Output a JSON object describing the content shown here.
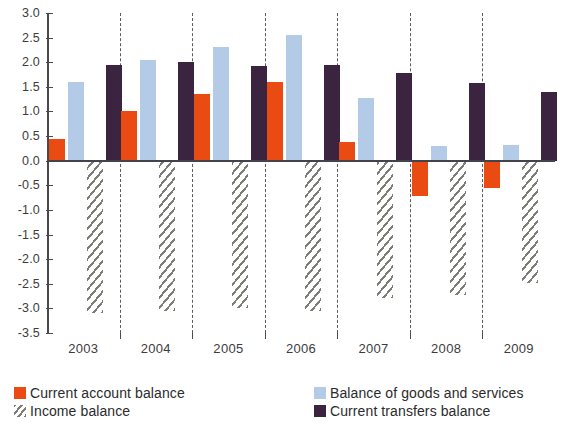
{
  "chart_data": {
    "type": "bar",
    "title": "",
    "subtitle": "",
    "xlabel": "",
    "ylabel": "",
    "categories": [
      "2003",
      "2004",
      "2005",
      "2006",
      "2007",
      "2008",
      "2009"
    ],
    "ylim": [
      -3.5,
      3.0
    ],
    "ytick_step": 0.5,
    "yticks": [
      "3.0",
      "2.5",
      "2.0",
      "1.5",
      "1.0",
      "0.5",
      "0.0",
      "-0.5",
      "-1.0",
      "-1.5",
      "-2.0",
      "-2.5",
      "-3.0",
      "-3.5"
    ],
    "ytick_values": [
      3.0,
      2.5,
      2.0,
      1.5,
      1.0,
      0.5,
      0.0,
      -0.5,
      -1.0,
      -1.5,
      -2.0,
      -2.5,
      -3.0,
      -3.5
    ],
    "grid": false,
    "legend_position": "bottom",
    "series": [
      {
        "name": "Current account balance",
        "key": "cab",
        "color": "#ea4b12",
        "values": [
          0.45,
          1.0,
          1.35,
          1.6,
          0.38,
          -0.72,
          -0.56
        ]
      },
      {
        "name": "Balance of goods and services",
        "key": "goods",
        "color": "#b3cbe6",
        "values": [
          1.6,
          2.05,
          2.3,
          2.55,
          1.28,
          0.3,
          0.32
        ]
      },
      {
        "name": "Income balance",
        "key": "income",
        "color": "#7d7d78",
        "pattern": "diagonal-hatch",
        "values": [
          -3.1,
          -3.05,
          -3.0,
          -3.05,
          -2.78,
          -2.73,
          -2.48
        ]
      },
      {
        "name": "Current transfers balance",
        "key": "transfer",
        "color": "#3a2440",
        "values": [
          1.95,
          2.0,
          1.93,
          1.95,
          1.78,
          1.57,
          1.4
        ]
      }
    ]
  },
  "legend": {
    "items": [
      {
        "label": "Current account balance",
        "key": "cab"
      },
      {
        "label": "Balance of goods and services",
        "key": "goods"
      },
      {
        "label": "Income balance",
        "key": "income"
      },
      {
        "label": "Current transfers balance",
        "key": "transfer"
      }
    ]
  }
}
